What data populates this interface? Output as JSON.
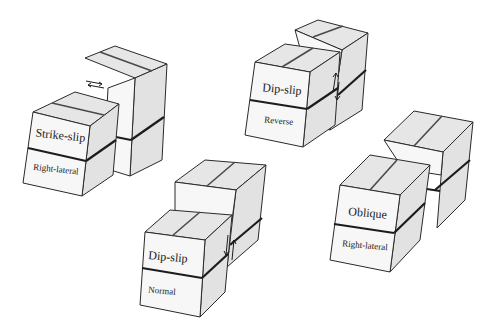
{
  "diagram": {
    "title": "",
    "blocks": [
      {
        "id": "strike-slip",
        "type_label": "Strike-slip",
        "sense_label": "Right-lateral"
      },
      {
        "id": "dip-slip-reverse",
        "type_label": "Dip-slip",
        "sense_label": "Reverse"
      },
      {
        "id": "dip-slip-normal",
        "type_label": "Dip-slip",
        "sense_label": "Normal"
      },
      {
        "id": "oblique",
        "type_label": "Oblique",
        "sense_label": "Right-lateral"
      }
    ]
  },
  "colors": {
    "background": "#ffffff",
    "face_front": "#f7f7f7",
    "face_top": "#e6e6e6",
    "face_side": "#e2e2e2",
    "edge": "#2a2a2a"
  }
}
